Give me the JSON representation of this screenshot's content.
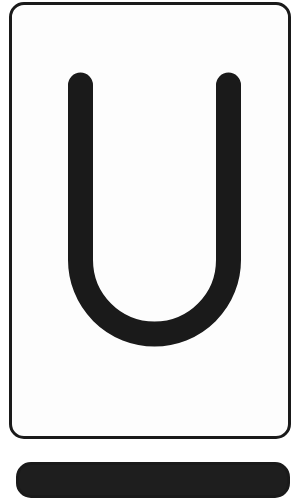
{
  "flashcard": {
    "letter": "U",
    "colors": {
      "border": "#1a1a1a",
      "glyph": "#1a1a1a",
      "background": "#fdfdfd"
    }
  },
  "next_card": {
    "visible": true,
    "color": "#1e1e1e"
  }
}
